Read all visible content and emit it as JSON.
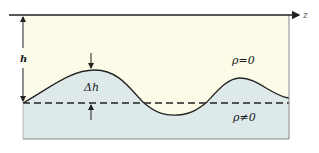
{
  "diagram": {
    "labels": {
      "height": "h",
      "amplitude": "Δh",
      "upper_region": "ρ=0",
      "lower_region": "ρ≠0",
      "axis": "z"
    },
    "colors": {
      "upper_fill": "#fbfbe8",
      "lower_fill": "#deeaea",
      "line": "#222222",
      "border": "#888888"
    }
  }
}
